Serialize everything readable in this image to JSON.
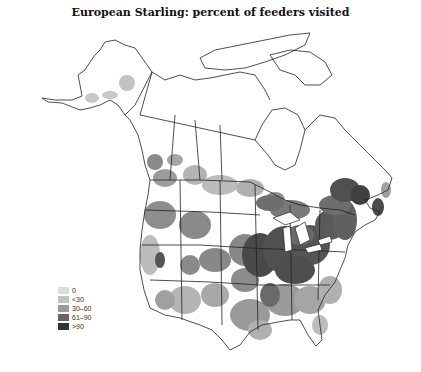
{
  "title": "European Starling: percent of feeders visited",
  "legend": {
    "items": [
      {
        "label": "0",
        "color": "#dcdcdc"
      },
      {
        "label": "<30",
        "color": "#c2c2c2"
      },
      {
        "label": "30–60",
        "color": "#9a9a9a"
      },
      {
        "label": "61–90",
        "color": "#666666"
      },
      {
        "label": ">90",
        "color": "#333333"
      }
    ]
  },
  "map": {
    "region": "North America (Alaska, Canada, contiguous United States)",
    "outline_color": "#222222",
    "background": "#ffffff"
  }
}
